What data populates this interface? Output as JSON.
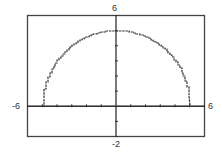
{
  "window": {
    "xmin_label": "-6",
    "xmax_label": "6",
    "ymin_label": "-2",
    "ymax_label": "6"
  },
  "colors": {
    "frame": "#444444",
    "axis": "#333333",
    "curve": "#333333",
    "background": "#ffffff"
  },
  "chart_data": {
    "type": "line",
    "title": "",
    "function": "y = sqrt(25 - x^2)",
    "xlabel": "",
    "ylabel": "",
    "xlim": [
      -6,
      6
    ],
    "ylim": [
      -2,
      6
    ],
    "xscale_tick": 1,
    "yscale_tick": 1,
    "grid": false,
    "legend": null,
    "x": [
      -5,
      -4.8,
      -4.5,
      -4,
      -3.5,
      -3,
      -2.5,
      -2,
      -1.5,
      -1,
      -0.5,
      0,
      0.5,
      1,
      1.5,
      2,
      2.5,
      3,
      3.5,
      4,
      4.5,
      4.8,
      5
    ],
    "values": [
      0,
      1.4,
      2.18,
      3,
      3.57,
      4,
      4.33,
      4.58,
      4.77,
      4.9,
      4.97,
      5,
      4.97,
      4.9,
      4.77,
      4.58,
      4.33,
      4,
      3.57,
      3,
      2.18,
      1.4,
      0
    ],
    "annotations": [
      "-6",
      "6",
      "-2",
      "6"
    ]
  }
}
